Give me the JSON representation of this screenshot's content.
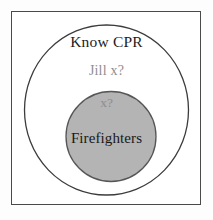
{
  "diagram": {
    "title_text": "Know CPR",
    "outer_set_label": "Know CPR",
    "annotation_outer": "Jill  x?",
    "annotation_inner": "x?",
    "inner_set_label": "Firefighters",
    "colors": {
      "page_background": "#fdfdfd",
      "frame_border": "#4a4a4a",
      "frame_fill": "#ffffff",
      "outer_ellipse_stroke": "#3c3c3c",
      "outer_ellipse_fill": "#ffffff",
      "inner_circle_stroke": "#565656",
      "inner_circle_fill": "#b4b4b4",
      "title_text_color": "#1c1c1c",
      "annotation_text_color": "#8e8e8e",
      "inner_label_color": "#181818"
    },
    "geometry": {
      "frame": {
        "x": 11,
        "y": 11,
        "width": 190,
        "height": 194
      },
      "outer_ellipse": {
        "cx": 106.5,
        "cy": 110,
        "rx": 82,
        "ry": 85
      },
      "inner_circle": {
        "cx": 111,
        "cy": 136.5,
        "r": 45
      }
    }
  }
}
